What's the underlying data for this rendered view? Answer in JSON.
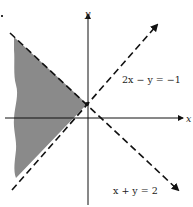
{
  "diagram": {
    "type": "inequality-region",
    "axes": {
      "x_label": "x",
      "y_label": "y"
    },
    "lines": [
      {
        "id": "line-2x-minus-y",
        "equation": "2x − y = −1",
        "style": "dashed"
      },
      {
        "id": "line-x-plus-y",
        "equation": "x + y = 2",
        "style": "dashed"
      }
    ],
    "shaded_region": {
      "description": "Region to the left of both dashed lines",
      "fill_color": "#8a8a8a"
    },
    "colors": {
      "line": "#111111",
      "axis": "#111111",
      "shade": "#8a8a8a"
    }
  }
}
